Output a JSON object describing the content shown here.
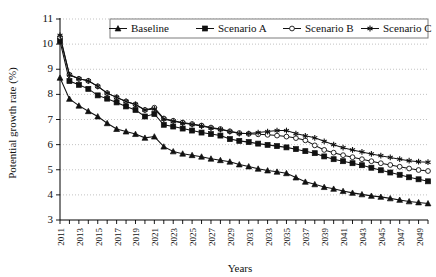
{
  "chart_data": {
    "type": "line",
    "title": "",
    "xlabel": "Years",
    "ylabel": "Potential growth rate (%)",
    "xlim": [
      2011,
      2050
    ],
    "ylim": [
      3,
      11
    ],
    "yticks": [
      3,
      4,
      5,
      6,
      7,
      8,
      9,
      10,
      11
    ],
    "grid": "horizontal-dotted",
    "legend_position": "top",
    "x": [
      2011,
      2012,
      2013,
      2014,
      2015,
      2016,
      2017,
      2018,
      2019,
      2020,
      2021,
      2022,
      2023,
      2024,
      2025,
      2026,
      2027,
      2028,
      2029,
      2030,
      2031,
      2032,
      2033,
      2034,
      2035,
      2036,
      2037,
      2038,
      2039,
      2040,
      2041,
      2042,
      2043,
      2044,
      2045,
      2046,
      2047,
      2048,
      2049,
      2050
    ],
    "xtick_labels": [
      "2011",
      "2013",
      "2015",
      "2017",
      "2019",
      "2021",
      "2023",
      "2025",
      "2027",
      "2029",
      "2031",
      "2033",
      "2035",
      "2037",
      "2039",
      "2041",
      "2043",
      "2045",
      "2047",
      "2049"
    ],
    "series": [
      {
        "name": "Baseline",
        "marker": "triangle",
        "values": [
          8.66,
          7.82,
          7.55,
          7.33,
          7.12,
          6.85,
          6.62,
          6.52,
          6.42,
          6.27,
          6.32,
          5.92,
          5.73,
          5.64,
          5.58,
          5.52,
          5.44,
          5.38,
          5.32,
          5.21,
          5.13,
          5.04,
          4.97,
          4.92,
          4.86,
          4.69,
          4.52,
          4.42,
          4.31,
          4.24,
          4.15,
          4.08,
          4.02,
          3.96,
          3.92,
          3.86,
          3.8,
          3.74,
          3.7,
          3.66
        ]
      },
      {
        "name": "Scenario A",
        "marker": "square",
        "values": [
          10.12,
          8.53,
          8.38,
          8.22,
          7.96,
          7.83,
          7.68,
          7.52,
          7.38,
          7.12,
          7.22,
          6.79,
          6.72,
          6.64,
          6.56,
          6.48,
          6.42,
          6.36,
          6.22,
          6.15,
          6.1,
          6.04,
          5.99,
          5.94,
          5.89,
          5.82,
          5.74,
          5.66,
          5.53,
          5.42,
          5.34,
          5.26,
          5.18,
          5.08,
          4.98,
          4.89,
          4.8,
          4.7,
          4.62,
          4.54
        ]
      },
      {
        "name": "Scenario B",
        "marker": "circle",
        "values": [
          10.28,
          8.78,
          8.62,
          8.54,
          8.32,
          8.05,
          7.88,
          7.72,
          7.6,
          7.38,
          7.47,
          7.04,
          6.95,
          6.88,
          6.82,
          6.76,
          6.68,
          6.62,
          6.53,
          6.46,
          6.43,
          6.41,
          6.39,
          6.36,
          6.32,
          6.26,
          6.17,
          5.97,
          5.79,
          5.68,
          5.58,
          5.5,
          5.42,
          5.34,
          5.26,
          5.19,
          5.12,
          5.05,
          4.99,
          4.95
        ]
      },
      {
        "name": "Scenario C",
        "marker": "asterisk",
        "values": [
          10.35,
          8.78,
          8.62,
          8.54,
          8.32,
          8.05,
          7.88,
          7.72,
          7.6,
          7.38,
          7.42,
          7.02,
          6.93,
          6.86,
          6.8,
          6.74,
          6.66,
          6.6,
          6.52,
          6.44,
          6.44,
          6.48,
          6.52,
          6.56,
          6.56,
          6.44,
          6.35,
          6.27,
          6.13,
          6.0,
          5.88,
          5.79,
          5.71,
          5.63,
          5.56,
          5.49,
          5.42,
          5.36,
          5.32,
          5.3
        ]
      }
    ]
  },
  "legend": {
    "items": [
      {
        "label": "Baseline"
      },
      {
        "label": "Scenario A"
      },
      {
        "label": "Scenario B"
      },
      {
        "label": "Scenario C"
      }
    ]
  },
  "axes": {
    "y_title": "Potential growth rate (%)",
    "x_title": "Years"
  }
}
